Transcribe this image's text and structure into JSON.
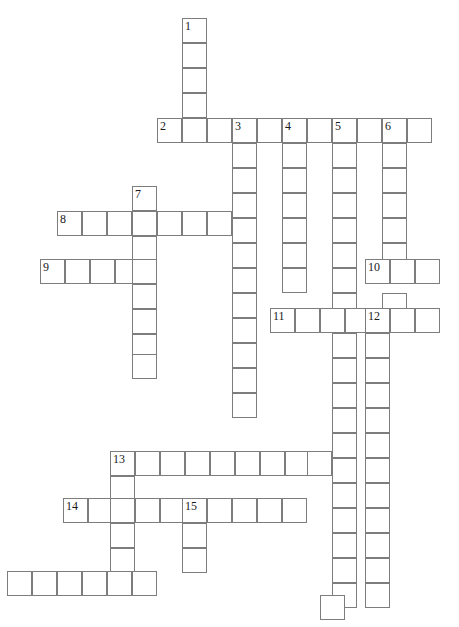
{
  "puzzle": {
    "title": "Crossword Grid",
    "cell_size": 25,
    "grid_origin_x": 7,
    "grid_origin_y": 18,
    "border_color": "#7d7d7d",
    "cell_fill": "#ffffff",
    "number_color": "#1a1a1a",
    "background": "#ffffff",
    "columns": 18,
    "rows": 24,
    "entries": [
      {
        "number": "1",
        "direction": "down",
        "col": 7,
        "row": 0,
        "length": 4
      },
      {
        "number": "2",
        "direction": "across",
        "col": 6,
        "row": 4,
        "length": 10
      },
      {
        "number": "3",
        "direction": "down",
        "col": 9,
        "row": 4,
        "length": 12
      },
      {
        "number": "4",
        "direction": "down",
        "col": 11,
        "row": 4,
        "length": 7
      },
      {
        "number": "5",
        "direction": "down",
        "col": 13,
        "row": 4,
        "length": 20
      },
      {
        "number": "6",
        "direction": "down",
        "col": 15,
        "row": 4,
        "length": 19
      },
      {
        "number": "7",
        "direction": "down",
        "col": 5,
        "row": 7,
        "length": 8
      },
      {
        "number": "8",
        "direction": "across",
        "col": 2,
        "row": 8,
        "length": 7
      },
      {
        "number": "9",
        "direction": "across",
        "col": 1,
        "row": 10,
        "length": 5
      },
      {
        "number": "10",
        "direction": "across",
        "col": 15,
        "row": 10,
        "length": 3
      },
      {
        "number": "11",
        "direction": "across",
        "col": 11,
        "row": 12,
        "length": 7
      },
      {
        "number": "12",
        "direction": "down",
        "col": 15,
        "row": 12,
        "length": 1
      },
      {
        "number": "13",
        "direction": "across",
        "col": 4,
        "row": 18,
        "length": 9
      },
      {
        "number": "14",
        "direction": "across",
        "col": 2,
        "row": 20,
        "length": 10
      },
      {
        "number": "15",
        "direction": "down",
        "col": 7,
        "row": 20,
        "length": 3
      }
    ],
    "cells": [
      {
        "x": 182,
        "y": 18,
        "n": "1"
      },
      {
        "x": 182,
        "y": 43,
        "n": ""
      },
      {
        "x": 182,
        "y": 68,
        "n": ""
      },
      {
        "x": 182,
        "y": 93,
        "n": ""
      },
      {
        "x": 157,
        "y": 118,
        "n": "2"
      },
      {
        "x": 182,
        "y": 118,
        "n": ""
      },
      {
        "x": 207,
        "y": 118,
        "n": ""
      },
      {
        "x": 232,
        "y": 118,
        "n": "3"
      },
      {
        "x": 257,
        "y": 118,
        "n": ""
      },
      {
        "x": 282,
        "y": 118,
        "n": "4"
      },
      {
        "x": 307,
        "y": 118,
        "n": ""
      },
      {
        "x": 332,
        "y": 118,
        "n": "5"
      },
      {
        "x": 357,
        "y": 118,
        "n": ""
      },
      {
        "x": 382,
        "y": 118,
        "n": "6"
      },
      {
        "x": 407,
        "y": 118,
        "n": ""
      },
      {
        "x": 232,
        "y": 143,
        "n": ""
      },
      {
        "x": 282,
        "y": 143,
        "n": ""
      },
      {
        "x": 332,
        "y": 143,
        "n": ""
      },
      {
        "x": 382,
        "y": 143,
        "n": ""
      },
      {
        "x": 232,
        "y": 168,
        "n": ""
      },
      {
        "x": 282,
        "y": 168,
        "n": ""
      },
      {
        "x": 332,
        "y": 168,
        "n": ""
      },
      {
        "x": 382,
        "y": 168,
        "n": ""
      },
      {
        "x": 132,
        "y": 186,
        "n": "7"
      },
      {
        "x": 232,
        "y": 193,
        "n": ""
      },
      {
        "x": 282,
        "y": 193,
        "n": ""
      },
      {
        "x": 332,
        "y": 193,
        "n": ""
      },
      {
        "x": 382,
        "y": 193,
        "n": ""
      },
      {
        "x": 57,
        "y": 211,
        "n": "8"
      },
      {
        "x": 82,
        "y": 211,
        "n": ""
      },
      {
        "x": 107,
        "y": 211,
        "n": ""
      },
      {
        "x": 132,
        "y": 211,
        "n": ""
      },
      {
        "x": 157,
        "y": 211,
        "n": ""
      },
      {
        "x": 182,
        "y": 211,
        "n": ""
      },
      {
        "x": 207,
        "y": 211,
        "n": ""
      },
      {
        "x": 232,
        "y": 218,
        "n": ""
      },
      {
        "x": 282,
        "y": 218,
        "n": ""
      },
      {
        "x": 332,
        "y": 218,
        "n": ""
      },
      {
        "x": 382,
        "y": 218,
        "n": ""
      },
      {
        "x": 132,
        "y": 236,
        "n": ""
      },
      {
        "x": 232,
        "y": 243,
        "n": ""
      },
      {
        "x": 282,
        "y": 243,
        "n": ""
      },
      {
        "x": 332,
        "y": 243,
        "n": ""
      },
      {
        "x": 382,
        "y": 243,
        "n": ""
      },
      {
        "x": 40,
        "y": 259,
        "n": "9"
      },
      {
        "x": 65,
        "y": 259,
        "n": ""
      },
      {
        "x": 90,
        "y": 259,
        "n": ""
      },
      {
        "x": 115,
        "y": 259,
        "n": ""
      },
      {
        "x": 132,
        "y": 259,
        "n": ""
      },
      {
        "x": 232,
        "y": 268,
        "n": ""
      },
      {
        "x": 282,
        "y": 268,
        "n": ""
      },
      {
        "x": 332,
        "y": 268,
        "n": ""
      },
      {
        "x": 365,
        "y": 259,
        "n": "10"
      },
      {
        "x": 390,
        "y": 259,
        "n": ""
      },
      {
        "x": 415,
        "y": 259,
        "n": ""
      },
      {
        "x": 132,
        "y": 284,
        "n": ""
      },
      {
        "x": 232,
        "y": 293,
        "n": ""
      },
      {
        "x": 332,
        "y": 293,
        "n": ""
      },
      {
        "x": 382,
        "y": 293,
        "n": ""
      },
      {
        "x": 270,
        "y": 308,
        "n": "11"
      },
      {
        "x": 295,
        "y": 308,
        "n": ""
      },
      {
        "x": 320,
        "y": 308,
        "n": ""
      },
      {
        "x": 345,
        "y": 308,
        "n": ""
      },
      {
        "x": 365,
        "y": 308,
        "n": "12"
      },
      {
        "x": 390,
        "y": 308,
        "n": ""
      },
      {
        "x": 415,
        "y": 308,
        "n": ""
      },
      {
        "x": 132,
        "y": 309,
        "n": ""
      },
      {
        "x": 232,
        "y": 318,
        "n": ""
      },
      {
        "x": 132,
        "y": 334,
        "n": ""
      },
      {
        "x": 232,
        "y": 343,
        "n": ""
      },
      {
        "x": 332,
        "y": 333,
        "n": ""
      },
      {
        "x": 365,
        "y": 333,
        "n": ""
      },
      {
        "x": 132,
        "y": 354,
        "n": ""
      },
      {
        "x": 232,
        "y": 368,
        "n": ""
      },
      {
        "x": 332,
        "y": 358,
        "n": ""
      },
      {
        "x": 365,
        "y": 358,
        "n": ""
      },
      {
        "x": 232,
        "y": 393,
        "n": ""
      },
      {
        "x": 332,
        "y": 383,
        "n": ""
      },
      {
        "x": 365,
        "y": 383,
        "n": ""
      },
      {
        "x": 332,
        "y": 408,
        "n": ""
      },
      {
        "x": 365,
        "y": 408,
        "n": ""
      },
      {
        "x": 332,
        "y": 433,
        "n": ""
      },
      {
        "x": 365,
        "y": 433,
        "n": ""
      },
      {
        "x": 110,
        "y": 451,
        "n": "13"
      },
      {
        "x": 135,
        "y": 451,
        "n": ""
      },
      {
        "x": 160,
        "y": 451,
        "n": ""
      },
      {
        "x": 185,
        "y": 451,
        "n": ""
      },
      {
        "x": 210,
        "y": 451,
        "n": ""
      },
      {
        "x": 235,
        "y": 451,
        "n": ""
      },
      {
        "x": 260,
        "y": 451,
        "n": ""
      },
      {
        "x": 285,
        "y": 451,
        "n": ""
      },
      {
        "x": 307,
        "y": 451,
        "n": ""
      },
      {
        "x": 332,
        "y": 458,
        "n": ""
      },
      {
        "x": 365,
        "y": 458,
        "n": ""
      },
      {
        "x": 110,
        "y": 476,
        "n": ""
      },
      {
        "x": 332,
        "y": 483,
        "n": ""
      },
      {
        "x": 365,
        "y": 483,
        "n": ""
      },
      {
        "x": 63,
        "y": 498,
        "n": "14"
      },
      {
        "x": 88,
        "y": 498,
        "n": ""
      },
      {
        "x": 110,
        "y": 498,
        "n": ""
      },
      {
        "x": 135,
        "y": 498,
        "n": ""
      },
      {
        "x": 160,
        "y": 498,
        "n": ""
      },
      {
        "x": 182,
        "y": 498,
        "n": "15"
      },
      {
        "x": 207,
        "y": 498,
        "n": ""
      },
      {
        "x": 232,
        "y": 498,
        "n": ""
      },
      {
        "x": 257,
        "y": 498,
        "n": ""
      },
      {
        "x": 282,
        "y": 498,
        "n": ""
      },
      {
        "x": 332,
        "y": 508,
        "n": ""
      },
      {
        "x": 365,
        "y": 508,
        "n": ""
      },
      {
        "x": 110,
        "y": 523,
        "n": ""
      },
      {
        "x": 182,
        "y": 523,
        "n": ""
      },
      {
        "x": 332,
        "y": 533,
        "n": ""
      },
      {
        "x": 365,
        "y": 533,
        "n": ""
      },
      {
        "x": 110,
        "y": 548,
        "n": ""
      },
      {
        "x": 182,
        "y": 548,
        "n": ""
      },
      {
        "x": 7,
        "y": 571,
        "n": ""
      },
      {
        "x": 32,
        "y": 571,
        "n": ""
      },
      {
        "x": 57,
        "y": 571,
        "n": ""
      },
      {
        "x": 82,
        "y": 571,
        "n": ""
      },
      {
        "x": 107,
        "y": 571,
        "n": ""
      },
      {
        "x": 132,
        "y": 571,
        "n": ""
      },
      {
        "x": 332,
        "y": 558,
        "n": ""
      },
      {
        "x": 365,
        "y": 558,
        "n": ""
      },
      {
        "x": 332,
        "y": 583,
        "n": ""
      },
      {
        "x": 365,
        "y": 583,
        "n": ""
      },
      {
        "x": 320,
        "y": 595,
        "n": ""
      }
    ]
  }
}
